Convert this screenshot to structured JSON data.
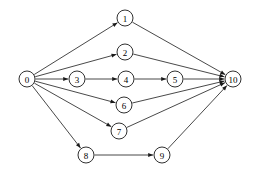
{
  "diagram": {
    "type": "directed-graph",
    "background_color": "#ffffff",
    "line_color": "#1a1a1a",
    "node_fill_color": "#ffffff",
    "node_radius": 8,
    "width": 254,
    "height": 177,
    "nodes": [
      {
        "id": "0",
        "label": "0",
        "x": 27,
        "y": 79
      },
      {
        "id": "1",
        "label": "1",
        "x": 125,
        "y": 18
      },
      {
        "id": "2",
        "label": "2",
        "x": 125,
        "y": 52
      },
      {
        "id": "3",
        "label": "3",
        "x": 77,
        "y": 79
      },
      {
        "id": "4",
        "label": "4",
        "x": 126,
        "y": 79
      },
      {
        "id": "5",
        "label": "5",
        "x": 175,
        "y": 79
      },
      {
        "id": "6",
        "label": "6",
        "x": 124,
        "y": 105
      },
      {
        "id": "7",
        "label": "7",
        "x": 119,
        "y": 131
      },
      {
        "id": "8",
        "label": "8",
        "x": 86,
        "y": 155
      },
      {
        "id": "9",
        "label": "9",
        "x": 162,
        "y": 155
      },
      {
        "id": "10",
        "label": "10",
        "x": 233,
        "y": 79
      }
    ],
    "edges": [
      {
        "from": "0",
        "to": "1"
      },
      {
        "from": "0",
        "to": "2"
      },
      {
        "from": "0",
        "to": "3"
      },
      {
        "from": "0",
        "to": "6"
      },
      {
        "from": "0",
        "to": "7"
      },
      {
        "from": "0",
        "to": "8"
      },
      {
        "from": "1",
        "to": "10"
      },
      {
        "from": "2",
        "to": "10"
      },
      {
        "from": "3",
        "to": "4"
      },
      {
        "from": "4",
        "to": "5"
      },
      {
        "from": "5",
        "to": "10"
      },
      {
        "from": "6",
        "to": "10"
      },
      {
        "from": "7",
        "to": "10"
      },
      {
        "from": "8",
        "to": "9"
      },
      {
        "from": "9",
        "to": "10"
      }
    ]
  }
}
